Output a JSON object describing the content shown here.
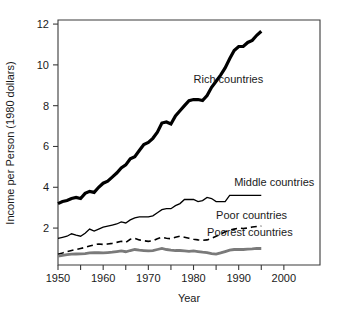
{
  "chart_data": {
    "type": "line",
    "title": "",
    "xlabel": "Year",
    "ylabel": "Income per Person (1980 dollars)",
    "xlim": [
      1950,
      2008
    ],
    "ylim": [
      0.19,
      12.2
    ],
    "grid": false,
    "legend": "inline-labels-right",
    "xticks": [
      1950,
      1960,
      1970,
      1980,
      1990,
      2000
    ],
    "xticklabels": [
      "1950",
      "1960",
      "1970",
      "1980",
      "1990",
      "2000"
    ],
    "xminorticks": [
      1955,
      1965,
      1975,
      1985,
      1995
    ],
    "yticks": [
      2,
      4,
      6,
      8,
      10,
      12
    ],
    "yticklabels": [
      "2",
      "4",
      "6",
      "8",
      "10",
      "12"
    ],
    "series": [
      {
        "name": "Rich countries",
        "style": "thick-solid-black",
        "color": "#000000",
        "width": 3.2,
        "dash": "none",
        "label_x": 1980,
        "label_y": 9.1,
        "x": [
          1950,
          1951,
          1952,
          1953,
          1954,
          1955,
          1956,
          1957,
          1958,
          1959,
          1960,
          1961,
          1962,
          1963,
          1964,
          1965,
          1966,
          1967,
          1968,
          1969,
          1970,
          1971,
          1972,
          1973,
          1974,
          1975,
          1976,
          1977,
          1978,
          1979,
          1980,
          1981,
          1982,
          1983,
          1984,
          1985,
          1986,
          1987,
          1988,
          1989,
          1990,
          1991,
          1992,
          1993,
          1994,
          1995
        ],
        "y": [
          3.2,
          3.3,
          3.35,
          3.45,
          3.5,
          3.45,
          3.7,
          3.8,
          3.75,
          4.0,
          4.2,
          4.3,
          4.5,
          4.7,
          4.95,
          5.1,
          5.4,
          5.5,
          5.8,
          6.1,
          6.2,
          6.4,
          6.7,
          7.15,
          7.2,
          7.1,
          7.5,
          7.75,
          8.0,
          8.25,
          8.3,
          8.3,
          8.25,
          8.5,
          8.9,
          9.2,
          9.5,
          9.85,
          10.3,
          10.7,
          10.9,
          10.9,
          11.1,
          11.2,
          11.45,
          11.65
        ]
      },
      {
        "name": "Middle countries",
        "style": "thin-solid-black",
        "color": "#000000",
        "width": 1.3,
        "dash": "none",
        "label_x": 1989,
        "label_y": 4.05,
        "x": [
          1950,
          1951,
          1952,
          1953,
          1954,
          1955,
          1956,
          1957,
          1958,
          1959,
          1960,
          1961,
          1962,
          1963,
          1964,
          1965,
          1966,
          1967,
          1968,
          1969,
          1970,
          1971,
          1972,
          1973,
          1974,
          1975,
          1976,
          1977,
          1978,
          1979,
          1980,
          1981,
          1982,
          1983,
          1984,
          1985,
          1986,
          1987,
          1988,
          1989,
          1990,
          1991,
          1992,
          1993,
          1994,
          1995
        ],
        "y": [
          1.5,
          1.55,
          1.6,
          1.72,
          1.65,
          1.6,
          1.75,
          1.95,
          1.85,
          1.95,
          2.05,
          2.1,
          2.15,
          2.2,
          2.3,
          2.25,
          2.4,
          2.5,
          2.55,
          2.55,
          2.55,
          2.6,
          2.75,
          2.9,
          2.95,
          2.95,
          3.1,
          3.2,
          3.4,
          3.4,
          3.4,
          3.3,
          3.35,
          3.5,
          3.45,
          3.3,
          3.3,
          3.3,
          3.6,
          3.6,
          3.6,
          3.6,
          3.6,
          3.6,
          3.6,
          3.6
        ]
      },
      {
        "name": "Poor countries",
        "style": "dashed-black",
        "color": "#000000",
        "width": 1.6,
        "dash": "6,4",
        "label_x": 1985,
        "label_y": 2.45,
        "x": [
          1950,
          1951,
          1952,
          1953,
          1954,
          1955,
          1956,
          1957,
          1958,
          1959,
          1960,
          1961,
          1962,
          1963,
          1964,
          1965,
          1966,
          1967,
          1968,
          1969,
          1970,
          1971,
          1972,
          1973,
          1974,
          1975,
          1976,
          1977,
          1978,
          1979,
          1980,
          1981,
          1982,
          1983,
          1984,
          1985,
          1986,
          1987,
          1988,
          1989,
          1990,
          1991,
          1992,
          1993,
          1994,
          1995
        ],
        "y": [
          0.72,
          0.78,
          0.85,
          0.9,
          0.95,
          1.0,
          1.05,
          1.12,
          1.18,
          1.22,
          1.2,
          1.22,
          1.25,
          1.3,
          1.35,
          1.3,
          1.45,
          1.5,
          1.42,
          1.38,
          1.35,
          1.38,
          1.48,
          1.55,
          1.5,
          1.48,
          1.55,
          1.6,
          1.55,
          1.5,
          1.45,
          1.42,
          1.4,
          1.42,
          1.5,
          1.6,
          1.7,
          1.82,
          1.9,
          1.95,
          2.0,
          1.98,
          2.0,
          2.05,
          2.08,
          2.1
        ]
      },
      {
        "name": "Poorest countries",
        "style": "thick-solid-gray",
        "color": "#7a7a7a",
        "width": 2.8,
        "dash": "none",
        "label_x": 1983,
        "label_y": 1.62,
        "x": [
          1950,
          1951,
          1952,
          1953,
          1954,
          1955,
          1956,
          1957,
          1958,
          1959,
          1960,
          1961,
          1962,
          1963,
          1964,
          1965,
          1966,
          1967,
          1968,
          1969,
          1970,
          1971,
          1972,
          1973,
          1974,
          1975,
          1976,
          1977,
          1978,
          1979,
          1980,
          1981,
          1982,
          1983,
          1984,
          1985,
          1986,
          1987,
          1988,
          1989,
          1990,
          1991,
          1992,
          1993,
          1994,
          1995
        ],
        "y": [
          0.62,
          0.66,
          0.7,
          0.72,
          0.73,
          0.74,
          0.75,
          0.78,
          0.8,
          0.79,
          0.78,
          0.8,
          0.82,
          0.85,
          0.88,
          0.84,
          0.9,
          0.95,
          0.92,
          0.9,
          0.88,
          0.9,
          0.95,
          1.0,
          0.95,
          0.92,
          0.9,
          0.9,
          0.88,
          0.86,
          0.88,
          0.85,
          0.82,
          0.8,
          0.75,
          0.72,
          0.78,
          0.85,
          0.92,
          0.95,
          0.96,
          0.95,
          0.97,
          0.98,
          1.0,
          1.0
        ]
      }
    ]
  }
}
